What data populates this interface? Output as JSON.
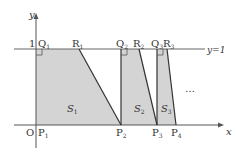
{
  "axes": {
    "x_label": "x",
    "y_label": "y",
    "origin_label": "O",
    "y_tick_label": "1",
    "line_label": "y=1"
  },
  "points": {
    "P1": {
      "main": "P",
      "sub": "1"
    },
    "P2": {
      "main": "P",
      "sub": "2"
    },
    "P3": {
      "main": "P",
      "sub": "3"
    },
    "P4": {
      "main": "P",
      "sub": "4"
    },
    "Q1": {
      "main": "Q",
      "sub": "1"
    },
    "Q2": {
      "main": "Q",
      "sub": "2"
    },
    "Q3": {
      "main": "Q",
      "sub": "3"
    },
    "R1": {
      "main": "R",
      "sub": "1"
    },
    "R2": {
      "main": "R",
      "sub": "2"
    },
    "R3": {
      "main": "R",
      "sub": "3"
    }
  },
  "regions": {
    "S1": {
      "main": "S",
      "sub": "1"
    },
    "S2": {
      "main": "S",
      "sub": "2"
    },
    "S3": {
      "main": "S",
      "sub": "3"
    }
  },
  "ellipsis": "…",
  "colors": {
    "fill": "#d4d4d4",
    "line": "#333333",
    "axis": "#555555"
  }
}
